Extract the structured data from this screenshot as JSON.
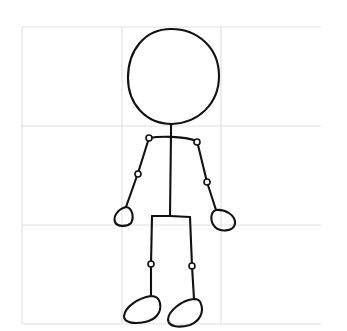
{
  "figure": {
    "background": "#ffffff",
    "ink_color": "#111111",
    "grid_color": "#e2e2e2"
  },
  "grid": {
    "columns": 3,
    "rows": 3,
    "x_lines": [
      22,
      122,
      221,
      321
    ],
    "y_lines": [
      27,
      126,
      225,
      324
    ]
  },
  "parts": [
    {
      "name": "head",
      "shape": "circle"
    },
    {
      "name": "neck-spine",
      "shape": "line"
    },
    {
      "name": "shoulders",
      "shape": "curve"
    },
    {
      "name": "left-arm",
      "shape": "line",
      "joints": 2
    },
    {
      "name": "right-arm",
      "shape": "line",
      "joints": 2
    },
    {
      "name": "left-hand",
      "shape": "oval"
    },
    {
      "name": "right-hand",
      "shape": "oval"
    },
    {
      "name": "hips",
      "shape": "line"
    },
    {
      "name": "left-leg",
      "shape": "line",
      "joints": 1
    },
    {
      "name": "right-leg",
      "shape": "line",
      "joints": 1
    },
    {
      "name": "left-foot",
      "shape": "oval"
    },
    {
      "name": "right-foot",
      "shape": "oval"
    }
  ]
}
